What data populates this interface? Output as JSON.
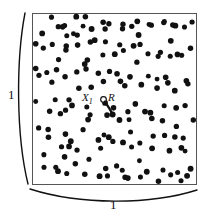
{
  "figure": {
    "colors": {
      "background": "#ffffff",
      "point": "#111111",
      "square_border": "#555555",
      "dimension_arc": "#111111",
      "annotation": "#111111"
    },
    "square": {
      "x": 32,
      "y": 13,
      "width": 165,
      "height": 172,
      "stroke_width": 1
    },
    "point_radius": 2.7,
    "labels": {
      "left_dimension": "1",
      "bottom_dimension": "1",
      "point_label": "X",
      "point_label_sub": "1",
      "radius_label": "R"
    },
    "annotation": {
      "x1_marker": {
        "cx": 103.5,
        "cy": 99.5,
        "r": 2.8
      },
      "radius_arc": {
        "from_x": 104.5,
        "from_y": 101.5,
        "to_x": 111.5,
        "to_y": 113.5
      },
      "target_point": {
        "cx": 112.5,
        "cy": 114.5,
        "r": 3.0
      }
    }
  },
  "chart_data": {
    "type": "scatter",
    "title": "",
    "xlabel": "1",
    "ylabel": "1",
    "xlim": [
      0,
      1
    ],
    "ylim": [
      0,
      1
    ],
    "grid": false,
    "legend": "none",
    "n_points": 112,
    "annotations": [
      {
        "text": "X1",
        "x": 0.433,
        "y": 0.5
      },
      {
        "text": "R",
        "x": 0.487,
        "y": 0.5
      }
    ],
    "points": [
      [
        40,
        30
      ],
      [
        47,
        22
      ],
      [
        56,
        27
      ],
      [
        62,
        26
      ],
      [
        64,
        36
      ],
      [
        70,
        22
      ],
      [
        72,
        34
      ],
      [
        78,
        21
      ],
      [
        80,
        32
      ],
      [
        83,
        18
      ],
      [
        88,
        30
      ],
      [
        95,
        24
      ],
      [
        100,
        20
      ],
      [
        104,
        31
      ],
      [
        110,
        22
      ],
      [
        118,
        26
      ],
      [
        126,
        19
      ],
      [
        131,
        28
      ],
      [
        137,
        22
      ],
      [
        142,
        33
      ],
      [
        149,
        20
      ],
      [
        155,
        30
      ],
      [
        161,
        25
      ],
      [
        167,
        19
      ],
      [
        173,
        29
      ],
      [
        179,
        23
      ],
      [
        186,
        31
      ],
      [
        191,
        22
      ],
      [
        37,
        44
      ],
      [
        44,
        52
      ],
      [
        52,
        47
      ],
      [
        58,
        58
      ],
      [
        63,
        44
      ],
      [
        69,
        55
      ],
      [
        75,
        49
      ],
      [
        81,
        60
      ],
      [
        86,
        46
      ],
      [
        92,
        57
      ],
      [
        97,
        45
      ],
      [
        103,
        56
      ],
      [
        108,
        47
      ],
      [
        114,
        59
      ],
      [
        120,
        44
      ],
      [
        126,
        53
      ],
      [
        132,
        48
      ],
      [
        138,
        60
      ],
      [
        144,
        45
      ],
      [
        150,
        55
      ],
      [
        156,
        50
      ],
      [
        162,
        61
      ],
      [
        168,
        46
      ],
      [
        174,
        57
      ],
      [
        180,
        49
      ],
      [
        187,
        58
      ],
      [
        192,
        44
      ],
      [
        36,
        70
      ],
      [
        43,
        80
      ],
      [
        50,
        73
      ],
      [
        57,
        84
      ],
      [
        62,
        71
      ],
      [
        68,
        82
      ],
      [
        74,
        75
      ],
      [
        80,
        86
      ],
      [
        86,
        72
      ],
      [
        92,
        83
      ],
      [
        98,
        76
      ],
      [
        104,
        87
      ],
      [
        110,
        73
      ],
      [
        116,
        84
      ],
      [
        122,
        77
      ],
      [
        128,
        88
      ],
      [
        134,
        74
      ],
      [
        140,
        85
      ],
      [
        146,
        78
      ],
      [
        152,
        89
      ],
      [
        158,
        75
      ],
      [
        164,
        86
      ],
      [
        170,
        79
      ],
      [
        176,
        90
      ],
      [
        182,
        76
      ],
      [
        189,
        87
      ],
      [
        38,
        100
      ],
      [
        45,
        112
      ],
      [
        52,
        104
      ],
      [
        59,
        115
      ],
      [
        65,
        102
      ],
      [
        71,
        113
      ],
      [
        77,
        106
      ],
      [
        83,
        117
      ],
      [
        89,
        103
      ],
      [
        95,
        114
      ],
      [
        101,
        107
      ],
      [
        107,
        118
      ],
      [
        113,
        104
      ],
      [
        119,
        115
      ],
      [
        125,
        108
      ],
      [
        131,
        119
      ],
      [
        137,
        105
      ],
      [
        143,
        116
      ],
      [
        149,
        109
      ],
      [
        155,
        120
      ],
      [
        161,
        106
      ],
      [
        167,
        117
      ],
      [
        173,
        110
      ],
      [
        179,
        121
      ],
      [
        185,
        107
      ],
      [
        191,
        118
      ],
      [
        37,
        130
      ],
      [
        44,
        142
      ],
      [
        51,
        134
      ],
      [
        58,
        145
      ],
      [
        64,
        132
      ],
      [
        70,
        143
      ],
      [
        76,
        136
      ],
      [
        82,
        147
      ],
      [
        88,
        133
      ],
      [
        94,
        144
      ],
      [
        100,
        137
      ],
      [
        106,
        148
      ],
      [
        112,
        134
      ],
      [
        118,
        145
      ],
      [
        124,
        138
      ],
      [
        130,
        149
      ],
      [
        136,
        135
      ],
      [
        142,
        146
      ],
      [
        148,
        139
      ],
      [
        154,
        150
      ],
      [
        160,
        136
      ],
      [
        166,
        147
      ],
      [
        172,
        140
      ],
      [
        178,
        151
      ],
      [
        184,
        137
      ],
      [
        190,
        148
      ],
      [
        39,
        160
      ],
      [
        46,
        172
      ],
      [
        53,
        164
      ],
      [
        60,
        175
      ],
      [
        66,
        162
      ],
      [
        72,
        173
      ],
      [
        78,
        166
      ],
      [
        84,
        177
      ],
      [
        90,
        163
      ],
      [
        96,
        174
      ],
      [
        102,
        167
      ],
      [
        108,
        178
      ],
      [
        114,
        164
      ],
      [
        120,
        175
      ],
      [
        126,
        168
      ],
      [
        132,
        179
      ],
      [
        138,
        165
      ],
      [
        144,
        176
      ],
      [
        150,
        169
      ],
      [
        156,
        180
      ],
      [
        162,
        166
      ],
      [
        168,
        177
      ],
      [
        174,
        170
      ],
      [
        180,
        181
      ],
      [
        186,
        167
      ],
      [
        192,
        178
      ]
    ]
  }
}
